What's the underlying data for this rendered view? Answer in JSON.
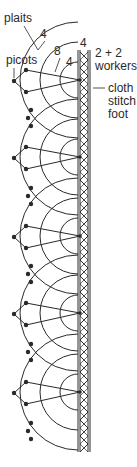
{
  "labels": {
    "plaits": "plaits",
    "plaits_count": "4",
    "picots": "picots",
    "fan_outer_count": "8",
    "fan_inner_count": "4",
    "foot_top_count": "4",
    "workers": "2 + 2",
    "workers_word": "workers",
    "foot_line1": "cloth",
    "foot_line2": "stitch",
    "foot_line3": "foot"
  },
  "colors": {
    "line": "#2a2a2a",
    "background": "#ffffff"
  },
  "layout": {
    "foot_x_left": 78,
    "foot_x_right": 90,
    "foot_top": 50,
    "foot_bottom": 452,
    "fan_centers_y": [
      80,
      157,
      236,
      313,
      392
    ],
    "fan_radii": [
      18,
      38,
      58
    ],
    "picot_points_between_fans": 3
  }
}
